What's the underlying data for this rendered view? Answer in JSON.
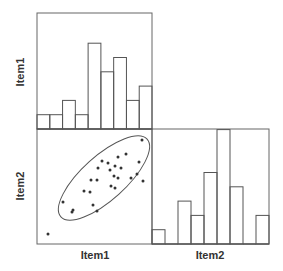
{
  "chart_data": {
    "type": "scatter-matrix",
    "title": "",
    "variables": [
      "Item1",
      "Item2"
    ],
    "panels": [
      {
        "position": "top-left",
        "type": "bar",
        "subtype": "histogram",
        "variable": "Item1",
        "bins": 9,
        "values": [
          1,
          1,
          2,
          1,
          6,
          4,
          5,
          2,
          3
        ]
      },
      {
        "position": "bottom-left",
        "type": "scatter",
        "xvar": "Item1",
        "yvar": "Item2",
        "points_px": [
          [
            142,
            140
          ],
          [
            118,
            157
          ],
          [
            126,
            154
          ],
          [
            102,
            161
          ],
          [
            108,
            163
          ],
          [
            115,
            166
          ],
          [
            139,
            162
          ],
          [
            121,
            168
          ],
          [
            110,
            170
          ],
          [
            98,
            168
          ],
          [
            137,
            174
          ],
          [
            114,
            176
          ],
          [
            131,
            178
          ],
          [
            91,
            180
          ],
          [
            97,
            180
          ],
          [
            118,
            178
          ],
          [
            143,
            181
          ],
          [
            111,
            186
          ],
          [
            115,
            188
          ],
          [
            84,
            191
          ],
          [
            90,
            192
          ],
          [
            63,
            202
          ],
          [
            73,
            210
          ],
          [
            72,
            212
          ],
          [
            93,
            205
          ],
          [
            97,
            211
          ],
          [
            48,
            234
          ]
        ],
        "ellipse": {
          "cx": 104,
          "cy": 178,
          "rx": 58,
          "ry": 22,
          "angle_deg": -42
        }
      },
      {
        "position": "bottom-right",
        "type": "bar",
        "subtype": "histogram",
        "variable": "Item2",
        "bins": 9,
        "values": [
          1,
          0,
          3,
          2,
          5,
          8,
          4,
          0,
          2
        ]
      }
    ],
    "row_labels": [
      "Item1",
      "Item2"
    ],
    "col_labels": [
      "Item1",
      "Item2"
    ],
    "grid": false,
    "legend": null
  },
  "labels": {
    "row1": "Item1",
    "row2": "Item2",
    "col1": "Item1",
    "col2": "Item2"
  },
  "colors": {
    "line": "#555555",
    "point": "#333333",
    "background": "#ffffff"
  }
}
